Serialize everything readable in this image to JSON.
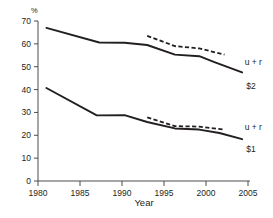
{
  "chart_data": {
    "type": "line",
    "title": "",
    "subtitle": "",
    "xlabel": "Year",
    "ylabel": "%",
    "ylim": [
      0,
      70
    ],
    "xlim": [
      1980,
      2005
    ],
    "grid": false,
    "legend": "inline-end-of-line",
    "y_ticks": [
      0,
      10,
      20,
      30,
      40,
      50,
      60,
      70
    ],
    "y_tick_labels": [
      "0",
      "10",
      "20",
      "30",
      "40",
      "50",
      "60",
      "70"
    ],
    "x_ticks": [
      1980,
      1985,
      1990,
      1995,
      2000,
      2005
    ],
    "x_tick_labels": [
      "1980",
      "1985",
      "1990",
      "1995",
      "2000",
      "2005"
    ],
    "annotations": [
      {
        "text": "u + r",
        "series": "u_plus_r_upper",
        "x": 2004.6,
        "y": 52.0
      },
      {
        "text": "$2",
        "series": "dollar2",
        "x": 2004.8,
        "y": 41.5
      },
      {
        "text": "u + r",
        "series": "u_plus_r_lower",
        "x": 2004.6,
        "y": 23.5
      },
      {
        "text": "$1",
        "series": "dollar1",
        "x": 2004.8,
        "y": 14.0
      }
    ],
    "series": [
      {
        "name": "$2",
        "key": "dollar2",
        "label": "$2",
        "style": "solid",
        "color": "#231f20",
        "x": [
          1981.0,
          1987.3,
          1990.3,
          1993.0,
          1996.3,
          1999.2,
          2001.0,
          2004.3
        ],
        "values": [
          67.0,
          60.6,
          60.5,
          59.5,
          55.3,
          54.6,
          52.0,
          47.5
        ]
      },
      {
        "name": "u + r (upper)",
        "key": "u_plus_r_upper",
        "label": "u + r",
        "style": "dashed",
        "color": "#231f20",
        "x": [
          1993.0,
          1996.3,
          1999.2,
          2002.2
        ],
        "values": [
          63.5,
          59.0,
          58.0,
          55.3
        ]
      },
      {
        "name": "$1",
        "key": "dollar1",
        "label": "$1",
        "style": "solid",
        "color": "#231f20",
        "x": [
          1981.0,
          1987.0,
          1990.3,
          1993.0,
          1996.3,
          1999.2,
          2001.6,
          2004.3
        ],
        "values": [
          40.7,
          28.7,
          28.8,
          25.8,
          23.0,
          22.5,
          21.0,
          18.3
        ]
      },
      {
        "name": "u + r (lower)",
        "key": "u_plus_r_lower",
        "label": "u + r",
        "style": "dashed",
        "color": "#231f20",
        "x": [
          1993.0,
          1996.3,
          1999.2,
          2002.2
        ],
        "values": [
          27.8,
          24.0,
          23.8,
          22.5
        ]
      }
    ]
  },
  "axes": {
    "y_unit_label": "%",
    "x_axis_title": "Year"
  },
  "colors": {
    "ink": "#231f20",
    "axis": "#4d4d4f",
    "background": "#ffffff"
  }
}
